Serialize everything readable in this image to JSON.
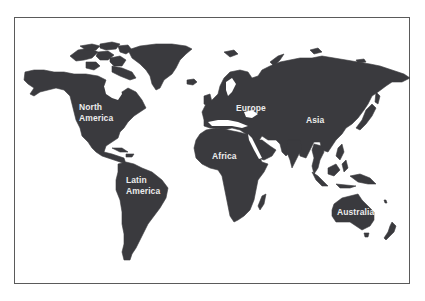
{
  "map": {
    "type": "world-continents",
    "colors": {
      "land": "#3a3a3e",
      "ocean": "#ffffff",
      "label": "#ececec",
      "border": "#5a5a5a"
    },
    "labels": {
      "north_america": {
        "line1": "North",
        "line2": "America"
      },
      "latin_america": {
        "line1": "Latin",
        "line2": "America"
      },
      "europe": {
        "line1": "Europe"
      },
      "africa": {
        "line1": "Africa"
      },
      "asia": {
        "line1": "Asia"
      },
      "australia": {
        "line1": "Australia"
      }
    }
  }
}
